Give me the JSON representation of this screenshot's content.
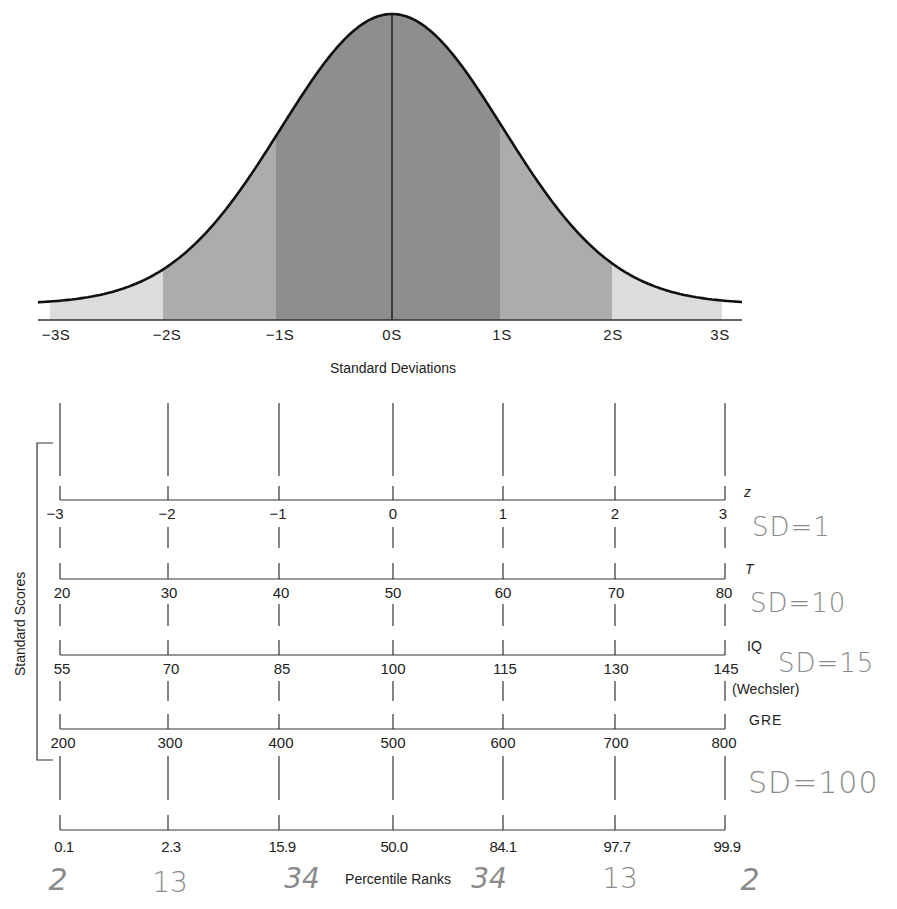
{
  "chart_data": [
    {
      "type": "area",
      "title": "Normal Distribution",
      "xlabel": "Standard Deviations",
      "ylabel": "",
      "categories": [
        "−3S",
        "−2S",
        "−1S",
        "0S",
        "1S",
        "2S",
        "3S"
      ],
      "x": [
        -3,
        -2,
        -1,
        0,
        1,
        2,
        3
      ],
      "shaded_regions": [
        {
          "from": -3,
          "to": -2,
          "shade": "light"
        },
        {
          "from": -2,
          "to": -1,
          "shade": "medium"
        },
        {
          "from": -1,
          "to": 1,
          "shade": "dark"
        },
        {
          "from": 1,
          "to": 2,
          "shade": "medium"
        },
        {
          "from": 2,
          "to": 3,
          "shade": "light"
        }
      ],
      "grid": false,
      "legend": "none"
    },
    {
      "type": "table",
      "title": "Standard Scores",
      "series": [
        {
          "name": "z",
          "values": [
            -3,
            -2,
            -1,
            0,
            1,
            2,
            3
          ]
        },
        {
          "name": "T",
          "values": [
            20,
            30,
            40,
            50,
            60,
            70,
            80
          ]
        },
        {
          "name": "IQ (Wechsler)",
          "values": [
            55,
            70,
            85,
            100,
            115,
            130,
            145
          ]
        },
        {
          "name": "GRE",
          "values": [
            200,
            300,
            400,
            500,
            600,
            700,
            800
          ]
        },
        {
          "name": "Percentile Ranks",
          "values": [
            0.1,
            2.3,
            15.9,
            50.0,
            84.1,
            97.7,
            99.9
          ]
        }
      ],
      "annotations": [
        "SD=1",
        "SD=10",
        "SD=15",
        "SD=100",
        "2",
        "13",
        "34",
        "34",
        "13",
        "2"
      ]
    }
  ],
  "curve": {
    "sd_labels": [
      "−3S",
      "−2S",
      "−1S",
      "0S",
      "1S",
      "2S",
      "3S"
    ],
    "axis_title": "Standard Deviations",
    "colors": {
      "light": "#dcdcdc",
      "medium": "#acacac",
      "dark": "#8e8e8e",
      "line": "#111111"
    }
  },
  "scales": {
    "group_title": "Standard Scores",
    "z": {
      "name": "z",
      "labels": [
        "−3",
        "−2",
        "−1",
        "0",
        "1",
        "2",
        "3"
      ],
      "note": "SD=1"
    },
    "t": {
      "name": "T",
      "labels": [
        "20",
        "30",
        "40",
        "50",
        "60",
        "70",
        "80"
      ],
      "note": "SD=10"
    },
    "iq": {
      "name": "IQ",
      "subname": "(Wechsler)",
      "labels": [
        "55",
        "70",
        "85",
        "100",
        "115",
        "130",
        "145"
      ],
      "note": "SD=15"
    },
    "gre": {
      "name": "GRE",
      "labels": [
        "200",
        "300",
        "400",
        "500",
        "600",
        "700",
        "800"
      ],
      "note": "SD=100"
    },
    "percentile": {
      "title": "Percentile Ranks",
      "labels": [
        "0.1",
        "2.3",
        "15.9",
        "50.0",
        "84.1",
        "97.7",
        "99.9"
      ]
    }
  },
  "handwritten_band_percents": [
    "2",
    "13",
    "34",
    "34",
    "13",
    "2"
  ]
}
